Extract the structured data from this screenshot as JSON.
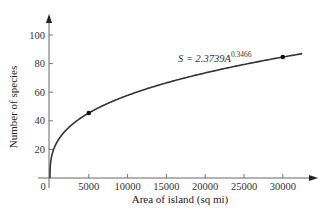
{
  "chart_data": {
    "type": "line",
    "title": "",
    "xlabel": "Area of island (sq mi)",
    "ylabel": "Number of species",
    "xlim": [
      0,
      33000
    ],
    "ylim": [
      0,
      110
    ],
    "x_ticks": [
      0,
      5000,
      10000,
      15000,
      20000,
      25000,
      30000
    ],
    "x_tick_labels": [
      "0",
      "5000",
      "10000",
      "15000",
      "20000",
      "25000",
      "30000"
    ],
    "y_ticks": [
      20,
      40,
      60,
      80,
      100
    ],
    "y_tick_labels": [
      "20",
      "40",
      "60",
      "80",
      "100"
    ],
    "grid": false,
    "legend": null,
    "annotation": {
      "text_prefix": "S = 2.3739A",
      "exponent": "0.3466",
      "full_text": "S = 2.3739A^0.3466"
    },
    "series": [
      {
        "name": "S = 2.3739A^0.3466",
        "function": {
          "coefficient": 2.3739,
          "exponent": 0.3466
        },
        "x_range": [
          0,
          32500
        ],
        "sample_points": [
          {
            "x": 0,
            "y": 0
          },
          {
            "x": 500,
            "y": 20.2
          },
          {
            "x": 1000,
            "y": 25.6
          },
          {
            "x": 2500,
            "y": 35.2
          },
          {
            "x": 5000,
            "y": 44.8
          },
          {
            "x": 10000,
            "y": 57.0
          },
          {
            "x": 15000,
            "y": 65.5
          },
          {
            "x": 20000,
            "y": 72.4
          },
          {
            "x": 25000,
            "y": 78.1
          },
          {
            "x": 30000,
            "y": 83.2
          },
          {
            "x": 32500,
            "y": 85.5
          }
        ]
      }
    ],
    "highlighted_points": [
      {
        "x": 5000,
        "y": 45
      },
      {
        "x": 30000,
        "y": 84
      }
    ]
  },
  "colors": {
    "axis": "#555555",
    "curve": "#333333",
    "point": "#111111",
    "text": "#333333"
  }
}
